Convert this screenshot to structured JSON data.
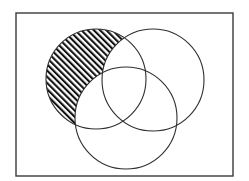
{
  "diagram": {
    "type": "venn",
    "set_count": 3,
    "universe": {
      "x": 16,
      "y": 13,
      "width": 217,
      "height": 163,
      "stroke": "#3a3a3a",
      "stroke_width": 1.4,
      "fill": "#ffffff"
    },
    "sets": [
      {
        "id": "A",
        "position": "upper-left",
        "cx": 96,
        "cy": 79,
        "r": 50
      },
      {
        "id": "B",
        "position": "upper-right",
        "cx": 153,
        "cy": 80,
        "r": 51
      },
      {
        "id": "C",
        "position": "bottom",
        "cx": 126,
        "cy": 118,
        "r": 51
      }
    ],
    "circle_stroke": "#2e2e2e",
    "circle_stroke_width": 1.1,
    "shaded_region": {
      "description": "A only (A minus B minus C)",
      "pattern": "diagonal-hatch",
      "direction": "top-left-to-bottom-right",
      "hatch_color": "#111111",
      "hatch_spacing": 4.4,
      "hatch_width": 2.1
    }
  }
}
